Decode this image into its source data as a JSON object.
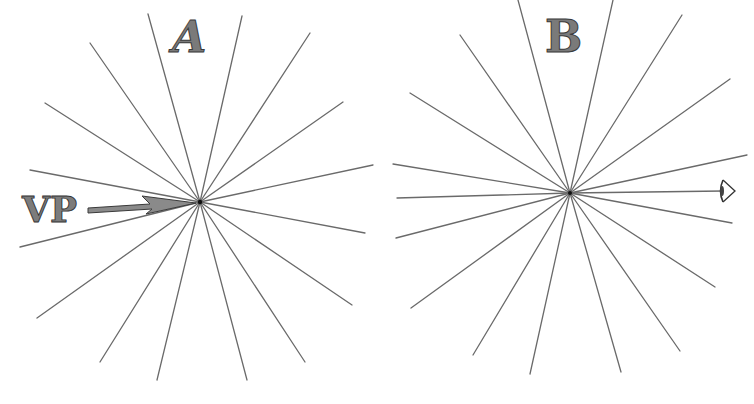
{
  "figure": {
    "panels": [
      {
        "id": "A",
        "label": "A",
        "center": [
          200,
          202
        ],
        "annotation": {
          "text": "VP",
          "meaning": "vanishing point arrow"
        },
        "rays": [
          [
            148,
            14
          ],
          [
            242,
            16
          ],
          [
            90,
            43
          ],
          [
            310,
            33
          ],
          [
            45,
            103
          ],
          [
            343,
            102
          ],
          [
            30,
            170
          ],
          [
            373,
            165
          ],
          [
            20,
            247
          ],
          [
            365,
            233
          ],
          [
            37,
            318
          ],
          [
            352,
            305
          ],
          [
            100,
            362
          ],
          [
            305,
            362
          ],
          [
            157,
            380
          ],
          [
            247,
            380
          ]
        ]
      },
      {
        "id": "B",
        "label": "B",
        "center": [
          570,
          193
        ],
        "annotation": {
          "icon": "eye-icon",
          "position": [
            723,
            191
          ]
        },
        "rays": [
          [
            518,
            0
          ],
          [
            613,
            0
          ],
          [
            460,
            35
          ],
          [
            682,
            15
          ],
          [
            410,
            93
          ],
          [
            730,
            79
          ],
          [
            393,
            164
          ],
          [
            747,
            155
          ],
          [
            397,
            198
          ],
          [
            723,
            191
          ],
          [
            396,
            238
          ],
          [
            732,
            223
          ],
          [
            411,
            308
          ],
          [
            715,
            287
          ],
          [
            473,
            355
          ],
          [
            680,
            351
          ],
          [
            530,
            374
          ],
          [
            621,
            372
          ]
        ]
      }
    ]
  },
  "colors": {
    "line": "#6a6a6a",
    "letter_fill": "#7a7a7a",
    "letter_outline": "#3a3a3a",
    "background": "#ffffff"
  }
}
